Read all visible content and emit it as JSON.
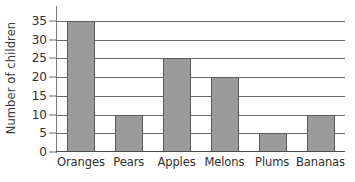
{
  "chart_data": {
    "type": "bar",
    "title": "",
    "subtitle": "",
    "xlabel": "",
    "ylabel": "Number of children",
    "categories": [
      "Oranges",
      "Pears",
      "Apples",
      "Melons",
      "Plums",
      "Bananas"
    ],
    "values": [
      35,
      10,
      25,
      20,
      5,
      10
    ],
    "series": [
      {
        "name": "Number of children",
        "values": [
          35,
          10,
          25,
          20,
          5,
          10
        ]
      }
    ],
    "ylim": [
      0,
      35
    ],
    "ytick_labels": [
      "35",
      "30",
      "25",
      "20",
      "15",
      "10",
      "5",
      "0"
    ],
    "ytick_values": [
      35,
      30,
      25,
      20,
      15,
      10,
      5,
      0
    ],
    "ytick_step": 5,
    "grid": true,
    "grid_axis": "y",
    "legend": false,
    "legend_position": "none",
    "annotations": [],
    "colors": {
      "bar_fill": "#9b9b9b",
      "bar_border": "#5a5a5a",
      "gridline": "#6a6a6a",
      "axis": "#4a4a4a",
      "text": "#2f2f2f",
      "background": "#ffffff"
    }
  }
}
